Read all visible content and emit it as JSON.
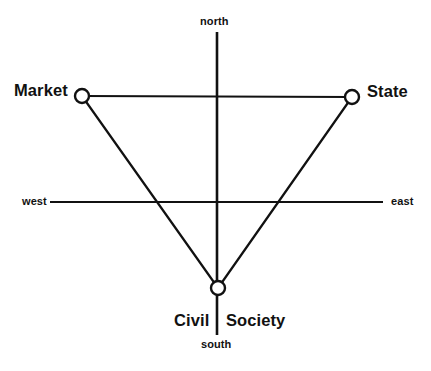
{
  "diagram": {
    "background_color": "#ffffff",
    "line_color": "#111111",
    "node_fill_color": "#ffffff",
    "axes": {
      "vertical": {
        "x": 217,
        "y_top": 32,
        "y_bottom": 335,
        "stroke_width": 2.6
      },
      "horizontal": {
        "y": 202,
        "x_left": 50,
        "x_right": 383,
        "stroke_width": 1.8
      }
    },
    "compass": {
      "north": "north",
      "south": "south",
      "west": "west",
      "east": "east"
    },
    "nodes": [
      {
        "id": "market",
        "label": "Market",
        "cx": 82,
        "cy": 96,
        "r": 7
      },
      {
        "id": "state",
        "label": "State",
        "cx": 352,
        "cy": 97,
        "r": 7
      },
      {
        "id": "civil-society",
        "label_part_1": "Civil",
        "label_part_2": "Society",
        "cx": 218,
        "cy": 288,
        "r": 7
      }
    ],
    "edges": [
      {
        "from": "market",
        "to": "state",
        "stroke_width": 2.2
      },
      {
        "from": "market",
        "to": "civil-society",
        "stroke_width": 2.2
      },
      {
        "from": "state",
        "to": "civil-society",
        "stroke_width": 2.2
      }
    ]
  }
}
